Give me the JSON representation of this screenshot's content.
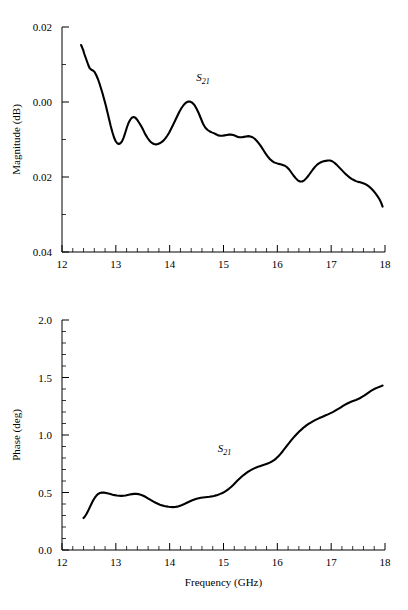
{
  "figure": {
    "background": "#ffffff",
    "ink": "#000000"
  },
  "chart_data": [
    {
      "type": "line",
      "name": "magnitude-plot",
      "title": "",
      "xlabel": "",
      "ylabel": "Magnitude (dB)",
      "xlim": [
        12,
        18
      ],
      "ylim": [
        0.04,
        -0.02
      ],
      "y_axis_inverted": true,
      "grid": false,
      "legend_position": "inline-annotation",
      "annotations": [
        {
          "text_main": "S",
          "text_sub": "21",
          "x": 14.62,
          "y": -0.0055
        }
      ],
      "xticks": [
        12,
        13,
        14,
        15,
        16,
        17,
        18
      ],
      "xticklabels": [
        "12",
        "13",
        "14",
        "15",
        "16",
        "17",
        "18"
      ],
      "xminor_step": 0.2,
      "yticks": [
        -0.02,
        0.0,
        0.02,
        0.04
      ],
      "yticklabels": [
        "0.02",
        "0.00",
        "0.02",
        "0.04"
      ],
      "yminor_step": 0.01,
      "series": [
        {
          "name": "S21 magnitude",
          "x": [
            12.355,
            12.375,
            12.395,
            12.415,
            12.44,
            12.465,
            12.49,
            12.515,
            12.545,
            12.575,
            12.605,
            12.635,
            12.665,
            12.695,
            12.725,
            12.755,
            12.785,
            12.815,
            12.845,
            12.875,
            12.905,
            12.935,
            12.965,
            12.995,
            13.025,
            13.055,
            13.085,
            13.115,
            13.145,
            13.175,
            13.205,
            13.235,
            13.265,
            13.295,
            13.33,
            13.365,
            13.4,
            13.435,
            13.47,
            13.5,
            13.53,
            13.56,
            13.59,
            13.62,
            13.65,
            13.68,
            13.71,
            13.745,
            13.78,
            13.815,
            13.85,
            13.885,
            13.92,
            13.955,
            13.99,
            14.025,
            14.06,
            14.1,
            14.14,
            14.18,
            14.22,
            14.26,
            14.3,
            14.34,
            14.38,
            14.42,
            14.46,
            14.5,
            14.54,
            14.58,
            14.62,
            14.66,
            14.7,
            14.74,
            14.78,
            14.82,
            14.86,
            14.9,
            14.94,
            14.98,
            15.02,
            15.06,
            15.1,
            15.14,
            15.18,
            15.22,
            15.26,
            15.3,
            15.34,
            15.38,
            15.42,
            15.46,
            15.5,
            15.54,
            15.58,
            15.62,
            15.66,
            15.7,
            15.74,
            15.78,
            15.82,
            15.86,
            15.9,
            15.94,
            15.98,
            16.02,
            16.06,
            16.1,
            16.14,
            16.18,
            16.22,
            16.26,
            16.3,
            16.34,
            16.38,
            16.42,
            16.46,
            16.5,
            16.54,
            16.58,
            16.62,
            16.66,
            16.7,
            16.74,
            16.78,
            16.82,
            16.86,
            16.9,
            16.94,
            16.98,
            17.02,
            17.06,
            17.1,
            17.14,
            17.18,
            17.22,
            17.26,
            17.3,
            17.34,
            17.38,
            17.42,
            17.46,
            17.5,
            17.54,
            17.58,
            17.62,
            17.66,
            17.7,
            17.74,
            17.78,
            17.82,
            17.86,
            17.9,
            17.93,
            17.955
          ],
          "y": [
            -0.0152,
            -0.0145,
            -0.0138,
            -0.0128,
            -0.0118,
            -0.0108,
            -0.0098,
            -0.009,
            -0.0086,
            -0.0084,
            -0.008,
            -0.0072,
            -0.0062,
            -0.005,
            -0.0036,
            -0.0022,
            -0.0006,
            0.001,
            0.0028,
            0.0046,
            0.0064,
            0.008,
            0.0094,
            0.0104,
            0.011,
            0.0112,
            0.011,
            0.0105,
            0.0095,
            0.0082,
            0.0068,
            0.0056,
            0.0048,
            0.0042,
            0.004,
            0.0042,
            0.0048,
            0.0056,
            0.0064,
            0.0072,
            0.0081,
            0.0089,
            0.0096,
            0.0102,
            0.0107,
            0.011,
            0.0112,
            0.0113,
            0.0112,
            0.011,
            0.0107,
            0.0103,
            0.0097,
            0.009,
            0.0082,
            0.0072,
            0.0062,
            0.005,
            0.0038,
            0.0026,
            0.0016,
            0.0008,
            0.0002,
            -0.0001,
            -0.0001,
            0.0002,
            0.0008,
            0.0018,
            0.003,
            0.0044,
            0.0058,
            0.0068,
            0.0074,
            0.0078,
            0.0081,
            0.0083,
            0.0086,
            0.0089,
            0.009,
            0.009,
            0.0089,
            0.0088,
            0.0087,
            0.0087,
            0.0088,
            0.009,
            0.0093,
            0.0094,
            0.0094,
            0.0093,
            0.0092,
            0.0091,
            0.0092,
            0.0094,
            0.0098,
            0.0104,
            0.0111,
            0.0119,
            0.0128,
            0.0137,
            0.0145,
            0.0152,
            0.0157,
            0.0161,
            0.0163,
            0.0165,
            0.0166,
            0.0168,
            0.017,
            0.0174,
            0.018,
            0.0188,
            0.0196,
            0.0203,
            0.0209,
            0.0212,
            0.0212,
            0.0209,
            0.0203,
            0.0196,
            0.0188,
            0.018,
            0.0173,
            0.0167,
            0.0163,
            0.016,
            0.0158,
            0.0157,
            0.0156,
            0.0156,
            0.0158,
            0.0162,
            0.0167,
            0.0173,
            0.0179,
            0.0185,
            0.0191,
            0.0196,
            0.0201,
            0.0205,
            0.0208,
            0.0211,
            0.0213,
            0.0214,
            0.0216,
            0.0218,
            0.0221,
            0.0225,
            0.023,
            0.0236,
            0.0243,
            0.0251,
            0.026,
            0.0269,
            0.0279,
            0.0289,
            0.0299,
            0.0308,
            0.0316,
            0.0323,
            0.0329,
            0.0334,
            0.0338,
            0.0341,
            0.0343,
            0.0344,
            0.0345,
            0.0346,
            0.0347,
            0.0349,
            0.0351,
            0.0354,
            0.0357,
            0.036,
            0.0362,
            0.0364,
            0.0365,
            0.0366,
            0.0366,
            0.0365,
            0.0363,
            0.036,
            0.0356,
            0.0352,
            0.0348,
            0.0344,
            0.0341,
            0.0338,
            0.0336,
            0.0335,
            0.0334,
            0.0333,
            0.0332,
            0.0331,
            0.033,
            0.0328,
            0.0325,
            0.0321,
            0.0316,
            0.0312,
            0.0309,
            0.0308,
            0.0308,
            0.031,
            0.0313,
            0.0317,
            0.0321,
            0.0324,
            0.0326,
            0.0327,
            0.0327,
            0.0326,
            0.0325,
            0.0323,
            0.0322,
            0.0321,
            0.0321,
            0.0322,
            0.0324,
            0.0327,
            0.0331,
            0.0335,
            0.0339,
            0.0343,
            0.0347,
            0.0351,
            0.0354,
            0.0355,
            0.0352,
            0.0345,
            0.0334,
            0.0318,
            0.0298,
            0.0274,
            0.0246,
            0.0215,
            0.0182,
            0.0148,
            0.0114,
            0.0082,
            0.0056,
            0.0038
          ]
        }
      ]
    },
    {
      "type": "line",
      "name": "phase-plot",
      "title": "",
      "xlabel": "Frequency (GHz)",
      "ylabel": "Phase (deg)",
      "xlim": [
        12,
        18
      ],
      "ylim": [
        0.0,
        2.0
      ],
      "y_axis_inverted": false,
      "grid": false,
      "legend_position": "inline-annotation",
      "annotations": [
        {
          "text_main": "S",
          "text_sub": "21",
          "x": 15.02,
          "y": 0.855
        }
      ],
      "xticks": [
        12,
        13,
        14,
        15,
        16,
        17,
        18
      ],
      "xticklabels": [
        "12",
        "13",
        "14",
        "15",
        "16",
        "17",
        "18"
      ],
      "xminor_step": 0.2,
      "yticks": [
        0.0,
        0.5,
        1.0,
        1.5,
        2.0
      ],
      "yticklabels": [
        "0.0",
        "0.5",
        "1.0",
        "1.5",
        "2.0"
      ],
      "yminor_step": 0.1,
      "series": [
        {
          "name": "S21 phase",
          "x": [
            12.4,
            12.43,
            12.46,
            12.49,
            12.52,
            12.55,
            12.58,
            12.61,
            12.64,
            12.67,
            12.7,
            12.74,
            12.78,
            12.82,
            12.86,
            12.9,
            12.94,
            12.98,
            13.02,
            13.06,
            13.1,
            13.14,
            13.18,
            13.22,
            13.26,
            13.3,
            13.34,
            13.38,
            13.42,
            13.46,
            13.5,
            13.54,
            13.58,
            13.62,
            13.66,
            13.7,
            13.74,
            13.78,
            13.82,
            13.86,
            13.9,
            13.94,
            13.98,
            14.02,
            14.06,
            14.1,
            14.14,
            14.18,
            14.22,
            14.26,
            14.3,
            14.34,
            14.38,
            14.42,
            14.46,
            14.5,
            14.54,
            14.58,
            14.62,
            14.66,
            14.7,
            14.74,
            14.78,
            14.82,
            14.86,
            14.9,
            14.94,
            14.98,
            15.02,
            15.06,
            15.1,
            15.14,
            15.18,
            15.22,
            15.26,
            15.3,
            15.34,
            15.38,
            15.42,
            15.46,
            15.5,
            15.54,
            15.58,
            15.62,
            15.66,
            15.7,
            15.74,
            15.78,
            15.82,
            15.86,
            15.9,
            15.94,
            15.98,
            16.02,
            16.06,
            16.1,
            16.14,
            16.18,
            16.22,
            16.26,
            16.3,
            16.34,
            16.38,
            16.42,
            16.46,
            16.5,
            16.54,
            16.58,
            16.62,
            16.66,
            16.7,
            16.74,
            16.78,
            16.82,
            16.86,
            16.9,
            16.94,
            16.98,
            17.02,
            17.06,
            17.1,
            17.14,
            17.18,
            17.22,
            17.26,
            17.3,
            17.34,
            17.38,
            17.42,
            17.46,
            17.5,
            17.54,
            17.58,
            17.62,
            17.66,
            17.7,
            17.74,
            17.78,
            17.82,
            17.86,
            17.9,
            17.93,
            17.955
          ],
          "y": [
            0.278,
            0.295,
            0.318,
            0.345,
            0.375,
            0.405,
            0.432,
            0.455,
            0.473,
            0.487,
            0.495,
            0.499,
            0.499,
            0.496,
            0.491,
            0.486,
            0.481,
            0.477,
            0.474,
            0.472,
            0.471,
            0.472,
            0.474,
            0.478,
            0.482,
            0.486,
            0.488,
            0.488,
            0.486,
            0.481,
            0.474,
            0.465,
            0.454,
            0.443,
            0.432,
            0.421,
            0.411,
            0.402,
            0.394,
            0.388,
            0.383,
            0.379,
            0.376,
            0.374,
            0.373,
            0.374,
            0.377,
            0.382,
            0.389,
            0.397,
            0.406,
            0.415,
            0.424,
            0.432,
            0.439,
            0.445,
            0.45,
            0.454,
            0.457,
            0.459,
            0.461,
            0.463,
            0.466,
            0.47,
            0.475,
            0.481,
            0.488,
            0.496,
            0.506,
            0.518,
            0.532,
            0.548,
            0.566,
            0.585,
            0.604,
            0.622,
            0.639,
            0.654,
            0.668,
            0.681,
            0.693,
            0.703,
            0.712,
            0.72,
            0.727,
            0.733,
            0.739,
            0.745,
            0.752,
            0.76,
            0.77,
            0.782,
            0.797,
            0.815,
            0.836,
            0.859,
            0.883,
            0.908,
            0.932,
            0.955,
            0.977,
            0.998,
            1.018,
            1.036,
            1.053,
            1.069,
            1.083,
            1.096,
            1.108,
            1.119,
            1.129,
            1.138,
            1.147,
            1.155,
            1.163,
            1.171,
            1.179,
            1.188,
            1.197,
            1.207,
            1.218,
            1.229,
            1.241,
            1.253,
            1.264,
            1.274,
            1.283,
            1.291,
            1.298,
            1.305,
            1.313,
            1.322,
            1.333,
            1.345,
            1.358,
            1.371,
            1.383,
            1.394,
            1.404,
            1.412,
            1.419,
            1.425,
            1.43,
            1.435,
            1.44,
            1.445,
            1.45,
            1.455,
            1.46,
            1.465,
            1.47,
            1.474,
            1.478,
            1.482,
            1.486,
            1.49,
            1.494,
            1.498,
            1.502,
            1.506,
            1.51,
            1.513,
            1.516,
            1.519,
            1.522,
            1.525,
            1.528,
            1.531,
            1.534,
            1.537,
            1.54,
            1.543,
            1.546,
            1.549,
            1.552,
            1.556,
            1.561,
            1.567,
            1.574,
            1.58
          ]
        }
      ]
    }
  ]
}
